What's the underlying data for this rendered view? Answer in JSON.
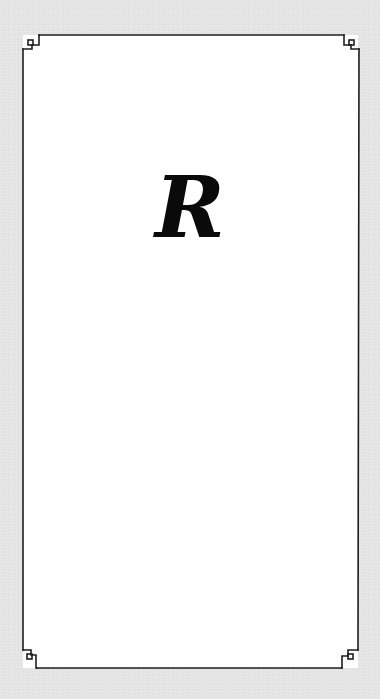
{
  "card": {
    "letter": "R",
    "background_color": "#e4e4e4",
    "card_color": "#ffffff",
    "border_color": "#1e1e1e",
    "border_style": "greek-key-corners",
    "corner_ornament": "square-key-icon"
  }
}
